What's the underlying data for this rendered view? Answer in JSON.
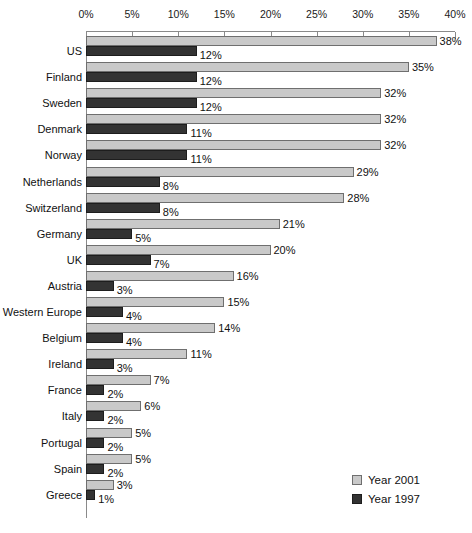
{
  "chart_data": {
    "type": "bar",
    "orientation": "horizontal",
    "title": "",
    "subtitle": "",
    "xlabel": "",
    "ylabel": "",
    "xlim": [
      0,
      40
    ],
    "xtick_labels": [
      "0%",
      "5%",
      "10%",
      "15%",
      "20%",
      "25%",
      "30%",
      "35%",
      "40%"
    ],
    "xticks": [
      0,
      5,
      10,
      15,
      20,
      25,
      30,
      35,
      40
    ],
    "grid": false,
    "legend_position": "bottom-right",
    "value_label_suffix": "%",
    "categories": [
      "US",
      "Finland",
      "Sweden",
      "Denmark",
      "Norway",
      "Netherlands",
      "Switzerland",
      "Germany",
      "UK",
      "Austria",
      "Western Europe",
      "Belgium",
      "Ireland",
      "France",
      "Italy",
      "Portugal",
      "Spain",
      "Greece"
    ],
    "series": [
      {
        "name": "Year 2001",
        "color": "#c9c9c9",
        "values": [
          38,
          35,
          32,
          32,
          32,
          29,
          28,
          21,
          20,
          16,
          15,
          14,
          11,
          7,
          6,
          5,
          5,
          3
        ],
        "labels": [
          "38%",
          "35%",
          "32%",
          "32%",
          "32%",
          "29%",
          "28%",
          "21%",
          "20%",
          "16%",
          "15%",
          "14%",
          "11%",
          "7%",
          "6%",
          "5%",
          "5%",
          "3%"
        ]
      },
      {
        "name": "Year 1997",
        "color": "#333333",
        "values": [
          12,
          12,
          12,
          11,
          11,
          8,
          8,
          5,
          7,
          3,
          4,
          4,
          3,
          2,
          2,
          2,
          2,
          1
        ],
        "labels": [
          "12%",
          "12%",
          "12%",
          "11%",
          "11%",
          "8%",
          "8%",
          "5%",
          "7%",
          "3%",
          "4%",
          "4%",
          "3%",
          "2%",
          "2%",
          "2%",
          "2%",
          "1%"
        ]
      }
    ]
  },
  "legend": {
    "items": [
      {
        "label": "Year 2001",
        "swatch": "y2001"
      },
      {
        "label": "Year 1997",
        "swatch": "y1997"
      }
    ]
  }
}
